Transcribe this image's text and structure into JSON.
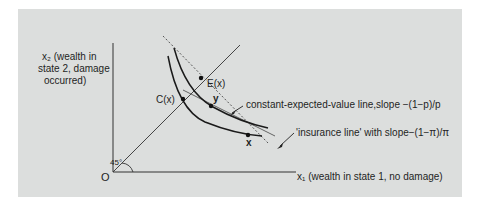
{
  "figure": {
    "background_color": "#dcdedd",
    "y_axis_label": [
      "x₂ (wealth in",
      "state 2, damage",
      "occurred)"
    ],
    "x_axis_label": "x₁ (wealth in state 1, no damage)",
    "origin_label": "O",
    "angle_label": "45°",
    "points": {
      "certainty_equivalent": "C(x)",
      "expected_value": "E(x)",
      "point_y": "y",
      "point_x": "x"
    },
    "annotations": {
      "constant_ev_line": "constant-expected-value line,slope −(1−p)/p",
      "insurance_line": "'insurance line' with slope−(1−π)/π"
    }
  }
}
